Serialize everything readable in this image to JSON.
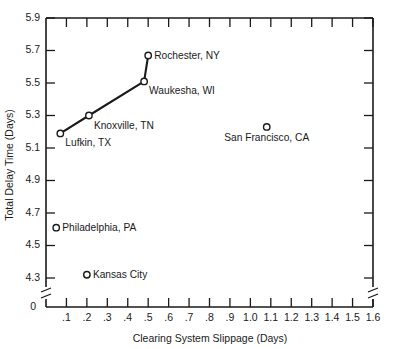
{
  "chart_data": {
    "type": "scatter",
    "title": "",
    "xlabel": "Clearing System Slippage (Days)",
    "ylabel": "Total Delay Time (Days)",
    "xlim": [
      0.0,
      1.6
    ],
    "ylim": [
      4.2,
      5.9
    ],
    "grid": false,
    "legend": "none",
    "axis_break": {
      "x_axis": true,
      "y_axis": true,
      "note": "broken axes near origin; y begins at 4.3 above the break, x begins near 0"
    },
    "x_tick_labels": [
      ".1",
      ".2",
      ".3",
      ".4",
      ".5",
      ".6",
      ".7",
      ".8",
      ".9",
      "1.0",
      "1.1",
      "1.2",
      "1.3",
      "1.4",
      "1.5",
      "1.6"
    ],
    "x_tick_values": [
      0.1,
      0.2,
      0.3,
      0.4,
      0.5,
      0.6,
      0.7,
      0.8,
      0.9,
      1.0,
      1.1,
      1.2,
      1.3,
      1.4,
      1.5,
      1.6
    ],
    "x_origin_label": "0",
    "y_tick_labels": [
      "5.9",
      "5.7",
      "5.5",
      "5.3",
      "5.1",
      "4.9",
      "4.7",
      "4.5",
      "4.3"
    ],
    "y_tick_values": [
      5.9,
      5.7,
      5.5,
      5.3,
      5.1,
      4.9,
      4.7,
      4.5,
      4.3
    ],
    "connected_series": {
      "name": "trend",
      "points": [
        {
          "label": "Lufkin, TX",
          "x": 0.07,
          "y": 5.19
        },
        {
          "label": "Knoxville, TN",
          "x": 0.21,
          "y": 5.3
        },
        {
          "label": "Waukesha, WI",
          "x": 0.48,
          "y": 5.51
        },
        {
          "label": "Rochester, NY",
          "x": 0.5,
          "y": 5.67
        }
      ]
    },
    "points": [
      {
        "label": "Lufkin, TX",
        "x": 0.07,
        "y": 5.19,
        "label_pos": "below-right",
        "connected": true
      },
      {
        "label": "Knoxville, TN",
        "x": 0.21,
        "y": 5.3,
        "label_pos": "below-right",
        "connected": true
      },
      {
        "label": "Waukesha, WI",
        "x": 0.48,
        "y": 5.51,
        "label_pos": "below-right",
        "connected": true
      },
      {
        "label": "Rochester, NY",
        "x": 0.5,
        "y": 5.67,
        "label_pos": "right",
        "connected": true
      },
      {
        "label": "San Francisco, CA",
        "x": 1.08,
        "y": 5.23,
        "label_pos": "below-center",
        "connected": false
      },
      {
        "label": "Philadelphia, PA",
        "x": 0.05,
        "y": 4.61,
        "label_pos": "right",
        "connected": false
      },
      {
        "label": "Kansas City",
        "x": 0.2,
        "y": 4.32,
        "label_pos": "right",
        "connected": false
      }
    ],
    "colors": {
      "axis": "#1a1a1a",
      "line": "#1a1a1a",
      "marker_fill": "#ffffff",
      "marker_stroke": "#1a1a1a",
      "background": "#ffffff"
    }
  }
}
